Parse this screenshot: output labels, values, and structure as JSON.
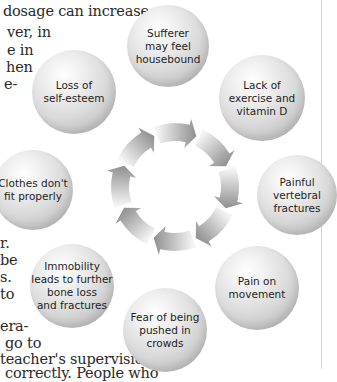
{
  "body_text": {
    "lines_top": [
      {
        "text": "dosage can increase",
        "x": 3,
        "y": 3
      },
      {
        "text": "ver, in",
        "x": 7,
        "y": 24
      },
      {
        "text": "e in",
        "x": 7,
        "y": 42
      },
      {
        "text": "hen",
        "x": 6,
        "y": 59
      },
      {
        "text": "e-",
        "x": 4,
        "y": 76
      }
    ],
    "lines_bottom": [
      {
        "text": "r.",
        "x": 0,
        "y": 235
      },
      {
        "text": "be",
        "x": 0,
        "y": 252
      },
      {
        "text": "s.",
        "x": 0,
        "y": 269
      },
      {
        "text": "to",
        "x": 0,
        "y": 286
      },
      {
        "text": "era-",
        "x": 0,
        "y": 318
      },
      {
        "text": "go to",
        "x": 5,
        "y": 335
      },
      {
        "text": "teacher's supervision",
        "x": 0,
        "y": 351
      },
      {
        "text": "correctly. People who",
        "x": 5,
        "y": 365
      }
    ]
  },
  "diagram": {
    "ring": {
      "cx": 175,
      "cy": 187,
      "r": 55,
      "segments": 8,
      "direction": "clockwise",
      "color_dark": "#8f8f8f",
      "color_light": "#f4f4f4"
    },
    "bubbles": [
      {
        "id": "sufferer-housebound",
        "label": "Sufferer\nmay feel\nhousebound",
        "cx": 168,
        "cy": 46,
        "r": 41
      },
      {
        "id": "lack-exercise",
        "label": "Lack of\nexercise and\nvitamin D",
        "cx": 262,
        "cy": 98,
        "r": 43
      },
      {
        "id": "painful-fractures",
        "label": "Painful\nvertebral\nfractures",
        "cx": 297,
        "cy": 195,
        "r": 40
      },
      {
        "id": "pain-movement",
        "label": "Pain on\nmovement",
        "cx": 257,
        "cy": 288,
        "r": 42
      },
      {
        "id": "fear-crowds",
        "label": "Fear of being\npushed in\ncrowds",
        "cx": 165,
        "cy": 330,
        "r": 42
      },
      {
        "id": "immobility",
        "label": "Immobility\nleads to further\nbone loss\nand fractures",
        "cx": 72,
        "cy": 286,
        "r": 42
      },
      {
        "id": "clothes-fit",
        "label": "Clothes don't\nfit properly",
        "cx": 33,
        "cy": 190,
        "r": 40
      },
      {
        "id": "loss-self-esteem",
        "label": "Loss of\nself-esteem",
        "cx": 74,
        "cy": 92,
        "r": 42
      }
    ]
  }
}
